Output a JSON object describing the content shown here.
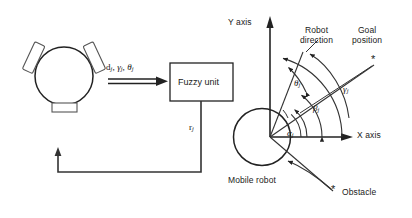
{
  "figure": {
    "type": "block-diagram-and-geometry",
    "background": "#ffffff",
    "stroke_color": "#222222",
    "text_color": "#1a1a1a"
  },
  "block_diagram": {
    "robot_icon_name": "mobile-robot-icon",
    "input_signal_label": "d_j, γ_j, θ_j",
    "input_signal_parts": [
      "d",
      "γ",
      "θ"
    ],
    "input_signal_subscript": "j",
    "processor_label": "Fuzzy unit",
    "feedback_label": "r_j",
    "feedback_symbol": "r",
    "feedback_subscript": "j"
  },
  "geometry_diagram": {
    "y_axis_label": "Y axis",
    "x_axis_label": "X axis",
    "robot_direction_label_line1": "Robot",
    "robot_direction_label_line2": "direction",
    "goal_label_line1": "Goal",
    "goal_label_line2": "position",
    "mobile_robot_label": "Mobile robot",
    "obstacle_label": "Obstacle",
    "goal_marker": "*",
    "obstacle_marker": "*",
    "angles": [
      {
        "symbol": "α",
        "subscript": "j",
        "name": "alpha-angle",
        "description": "angle between X axis and obstacle direction"
      },
      {
        "symbol": "β",
        "subscript": "j",
        "name": "beta-angle",
        "description": "angle between X axis and goal direction"
      },
      {
        "symbol": "θ",
        "subscript": "j",
        "name": "theta-angle",
        "description": "angle between robot direction and goal direction"
      },
      {
        "symbol": "γ",
        "subscript": "j",
        "name": "gamma-angle",
        "description": "angle between X axis and robot direction"
      }
    ]
  }
}
